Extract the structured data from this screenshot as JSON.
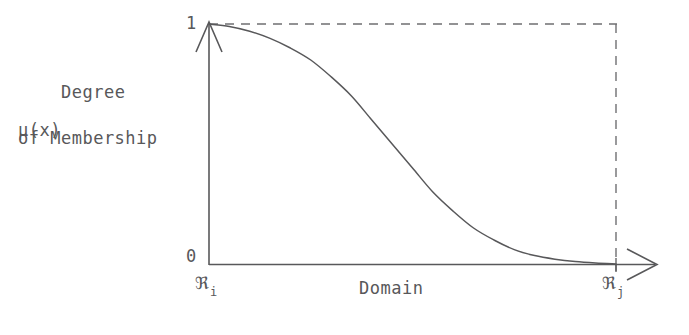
{
  "figure": {
    "background_color": "#ffffff",
    "line_color": "#58585a",
    "y_axis_title_line1": "Degree",
    "y_axis_title_line2": "of Membership",
    "y_axis_symbol": "μ(x)",
    "y_tick_top": "1",
    "y_tick_bottom": "0",
    "x_axis_title": "Domain",
    "x_start_label": "ℜ",
    "x_start_sub": "i",
    "x_end_label": "ℜ",
    "x_end_sub": "j"
  },
  "chart_data": {
    "type": "line",
    "title": "",
    "xlabel": "Domain",
    "ylabel": "Degree of Membership μ(x)",
    "xlim": [
      0,
      1
    ],
    "ylim": [
      0,
      1
    ],
    "x_tick_labels": [
      "ℜi",
      "ℜj"
    ],
    "y_tick_labels": [
      "0",
      "1"
    ],
    "grid": false,
    "legend": "none",
    "annotations": [
      "dashed guide line at μ = 1 from ℜi to ℜj",
      "dashed vertical guide line at x = ℜj",
      "y-axis drawn as upward arrow",
      "x-axis drawn as rightward arrow extending past ℜj"
    ],
    "series": [
      {
        "name": "Z-shaped (decreasing sigmoid) membership function",
        "x": [
          0.0,
          0.05,
          0.1,
          0.15,
          0.2,
          0.25,
          0.3,
          0.35,
          0.4,
          0.45,
          0.5,
          0.55,
          0.6,
          0.65,
          0.7,
          0.75,
          0.8,
          0.85,
          0.9,
          0.95,
          1.0
        ],
        "y": [
          1.0,
          0.99,
          0.97,
          0.94,
          0.9,
          0.85,
          0.78,
          0.7,
          0.6,
          0.5,
          0.4,
          0.3,
          0.22,
          0.15,
          0.1,
          0.06,
          0.035,
          0.02,
          0.01,
          0.004,
          0.0
        ]
      }
    ],
    "dashed_box": {
      "top_y": 1.0,
      "right_x": 1.0
    }
  }
}
